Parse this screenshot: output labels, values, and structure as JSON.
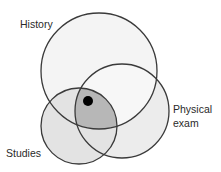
{
  "diagram": {
    "type": "venn",
    "sets": [
      {
        "id": "history",
        "label": "History"
      },
      {
        "id": "physical",
        "label_line1": "Physical",
        "label_line2": "exam"
      },
      {
        "id": "studies",
        "label": "Studies"
      }
    ],
    "marker": "diagnosis-dot",
    "colors": {
      "fill_single": "#f1f1f1",
      "fill_studies": "#e3e3e3",
      "fill_intersection": "#b7b7b7",
      "stroke": "#3a3a3a",
      "dot": "#000000"
    }
  }
}
